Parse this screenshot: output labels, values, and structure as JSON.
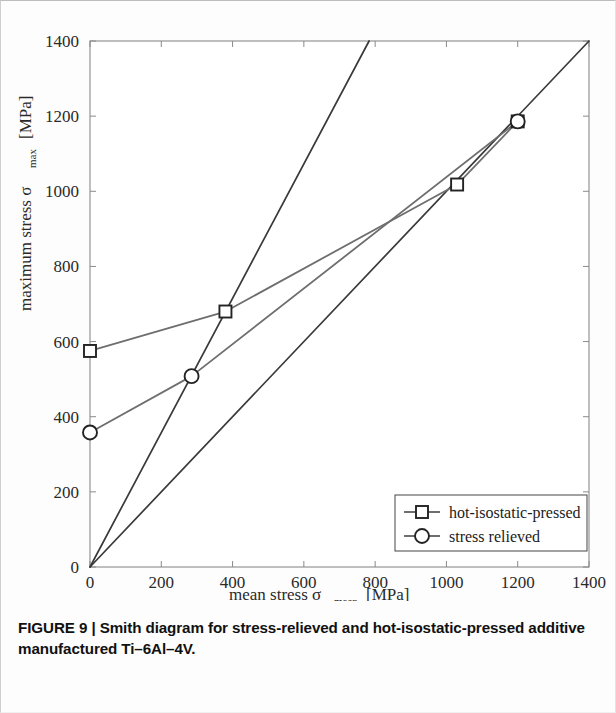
{
  "figure": {
    "caption_label": "FIGURE 9",
    "caption_separator": "|",
    "caption_text": "Smith diagram for stress-relieved and hot-isostatic-pressed additive manufactured Ti–6Al–4V."
  },
  "axes": {
    "x_title_main": "mean stress σ",
    "x_title_sub": "mean",
    "x_title_unit": "[MPa]",
    "y_title_main": "maximum stress σ",
    "y_title_sub": "max",
    "y_title_unit": "[MPa]",
    "x_ticks": [
      "0",
      "200",
      "400",
      "600",
      "800",
      "1000",
      "1200",
      "1400"
    ],
    "y_ticks": [
      "0",
      "200",
      "400",
      "600",
      "800",
      "1000",
      "1200",
      "1400"
    ]
  },
  "legend": {
    "items": [
      {
        "label": "hot-isostatic-pressed",
        "marker": "square"
      },
      {
        "label": "stress relieved",
        "marker": "circle"
      }
    ]
  },
  "colors": {
    "series": "#6e6e6e",
    "reference_line": "#3a3a3a",
    "axis": "#8a8a8a",
    "text": "#1c1c1c",
    "background": "#ffffff"
  },
  "chart_data": {
    "type": "line",
    "title": "",
    "xlabel": "mean stress σmean [MPa]",
    "ylabel": "maximum stress σmax [MPa]",
    "xlim": [
      0,
      1400
    ],
    "ylim": [
      0,
      1400
    ],
    "xticks": [
      0,
      200,
      400,
      600,
      800,
      1000,
      1200,
      1400
    ],
    "yticks": [
      0,
      200,
      400,
      600,
      800,
      1000,
      1200,
      1400
    ],
    "grid": false,
    "legend_position": "lower right",
    "series": [
      {
        "name": "hot-isostatic-pressed",
        "marker": "square",
        "x": [
          0,
          380,
          1030,
          1200
        ],
        "y": [
          575,
          680,
          1018,
          1186
        ]
      },
      {
        "name": "stress relieved",
        "marker": "circle",
        "x": [
          0,
          285,
          1200
        ],
        "y": [
          358,
          508,
          1186
        ]
      }
    ],
    "reference_lines": [
      {
        "name": "sigma_max = sigma_mean",
        "x": [
          0,
          1400
        ],
        "y": [
          0,
          1400
        ]
      },
      {
        "name": "sigma_max = 1.79 sigma_mean",
        "x": [
          0,
          783
        ],
        "y": [
          0,
          1400
        ]
      }
    ]
  }
}
